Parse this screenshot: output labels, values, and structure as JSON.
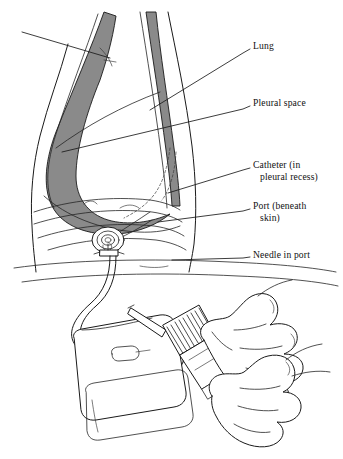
{
  "figure": {
    "background_color": "#ffffff",
    "ink_color": "#1a1a1a",
    "shade_color": "#8a8a8a"
  },
  "callouts": [
    {
      "id": "lung",
      "line1": "Lung",
      "line2": "",
      "text_x": 253,
      "text_y": 40,
      "leader": "M 250 49 L 243 53 L 150 110"
    },
    {
      "id": "pleural-space",
      "line1": "Pleural space",
      "line2": "",
      "text_x": 253,
      "text_y": 97,
      "leader": "M 250 106 L 243 109 L 62 152"
    },
    {
      "id": "catheter",
      "line1": "Catheter (in",
      "line2": "pleural  recess)",
      "text_x": 253,
      "text_y": 159,
      "leader": "M 250 168 L 243 170 L 168 193"
    },
    {
      "id": "port",
      "line1": "Port (beneath",
      "line2": "skin)",
      "text_x": 253,
      "text_y": 200,
      "leader": "M 250 209 L 243 211 L 158 222"
    },
    {
      "id": "needle-in-port",
      "line1": "Needle in port",
      "line2": "",
      "text_x": 253,
      "text_y": 249,
      "leader": "M 250 257 L 243 258 L 172 260"
    }
  ],
  "anatomy": {
    "torso_label": "Chest wall in lateral decubitus",
    "pleural_shading_color": "#8a8a8a",
    "port_label": "Implanted subcutaneous port",
    "bed_line_label": "Bed surface"
  },
  "apparatus": {
    "bag_label": "Drainage collection bag",
    "tubing_label": "Connecting tubing",
    "syringe_label": "Ribbed pump barrel",
    "hands_label": "Clinician hands"
  }
}
